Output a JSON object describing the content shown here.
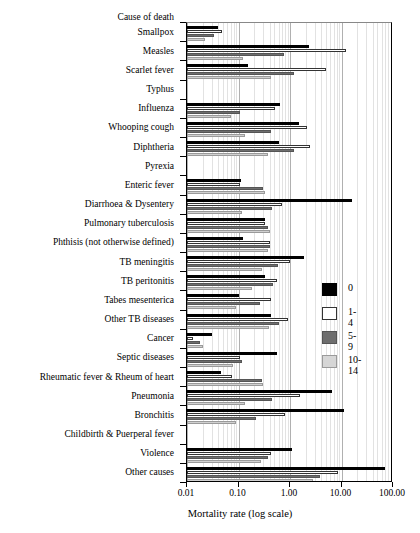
{
  "chart_data": {
    "type": "bar",
    "orientation": "horizontal",
    "title": "",
    "xlabel": "Mortality rate (log scale)",
    "ylabel": "Cause of death",
    "xscale": "log",
    "xlim": [
      0.01,
      100.0
    ],
    "xticks": [
      0.01,
      0.1,
      1.0,
      10.0,
      100.0
    ],
    "xticklabels": [
      "0.01",
      "0.10",
      "1.00",
      "10.00",
      "100.00"
    ],
    "grid": true,
    "legend_position": "center-right",
    "legend_title": "",
    "categories": [
      "Smallpox",
      "Measles",
      "Scarlet fever",
      "Typhus",
      "Influenza",
      "Whooping cough",
      "Diphtheria",
      "Pyrexia",
      "Enteric fever",
      "Diarrhoea & Dysentery",
      "Pulmonary tuberculosis",
      "Phthisis (not otherwise defined)",
      "TB meningitis",
      "TB peritonitis",
      "Tabes mesenterica",
      "Other TB diseases",
      "Cancer",
      "Septic diseases",
      "Rheumatic fever & Rheum of heart",
      "Pneumonia",
      "Bronchitis",
      "Childbirth & Puerperal fever",
      "Violence",
      "Other causes"
    ],
    "series": [
      {
        "name": "0",
        "color": "#000000",
        "values": [
          0.04,
          2.3,
          0.15,
          null,
          0.65,
          1.5,
          0.6,
          null,
          0.11,
          16.0,
          0.33,
          0.12,
          1.9,
          0.32,
          0.1,
          0.42,
          0.03,
          0.55,
          0.045,
          6.5,
          11.0,
          null,
          1.1,
          70.0
        ]
      },
      {
        "name": "1-4",
        "color": "#ffffff",
        "values": [
          0.048,
          12.0,
          5.0,
          null,
          0.52,
          2.1,
          2.5,
          null,
          0.105,
          0.7,
          0.33,
          0.4,
          1.0,
          0.55,
          0.42,
          0.9,
          0.013,
          0.105,
          0.075,
          1.55,
          0.8,
          null,
          0.42,
          8.5
        ]
      },
      {
        "name": "5-9",
        "color": "#6e6e6e",
        "values": [
          0.033,
          0.75,
          1.2,
          null,
          0.105,
          0.42,
          1.2,
          null,
          0.3,
          0.44,
          0.37,
          0.4,
          0.58,
          0.47,
          0.26,
          0.6,
          0.018,
          0.115,
          0.29,
          0.44,
          0.22,
          null,
          0.38,
          3.9
        ]
      },
      {
        "name": "10-14",
        "color": "#d0d0d0",
        "values": [
          0.022,
          0.12,
          0.42,
          null,
          0.072,
          0.135,
          0.37,
          null,
          0.33,
          0.115,
          0.4,
          0.38,
          0.28,
          0.185,
          0.088,
          0.39,
          0.02,
          0.078,
          0.3,
          0.135,
          0.09,
          null,
          0.27,
          2.8
        ]
      }
    ],
    "legend_entries": [
      {
        "label": "0",
        "color": "#000000"
      },
      {
        "label": "1-4",
        "color": "#ffffff"
      },
      {
        "label": "5-9",
        "color": "#6e6e6e"
      },
      {
        "label": "10-14",
        "color": "#d0d0d0"
      }
    ]
  }
}
